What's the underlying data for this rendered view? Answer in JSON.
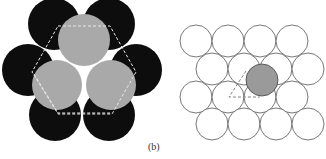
{
  "figure": {
    "caption": "(b)",
    "colors": {
      "black_sphere": "#0d0d0d",
      "gray_sphere": "#a9a9a9",
      "outline_circle_stroke": "#555555",
      "highlight_sphere": "#9a9a9a",
      "dashed_line_light": "#e8e8e8",
      "dashed_line_dark": "#666666"
    },
    "left_panel": {
      "description": "close-packed spheres: six black spheres with three gray spheres on top, dashed hexagon outline and triangle",
      "black_spheres": [
        {
          "cx": 54,
          "cy": 24,
          "r": 26
        },
        {
          "cx": 109,
          "cy": 24,
          "r": 26
        },
        {
          "cx": 28,
          "cy": 70,
          "r": 26
        },
        {
          "cx": 136,
          "cy": 70,
          "r": 26
        },
        {
          "cx": 55,
          "cy": 115,
          "r": 26
        },
        {
          "cx": 109,
          "cy": 115,
          "r": 26
        }
      ],
      "gray_spheres": [
        {
          "cx": 84,
          "cy": 40,
          "r": 26
        },
        {
          "cx": 57,
          "cy": 85,
          "r": 25
        },
        {
          "cx": 111,
          "cy": 85,
          "r": 25
        }
      ],
      "dashed_hexagon": "58,26 110,26 136,72 110,114 58,114 32,72",
      "dashed_triangle": "40,78 84,28 ... ",
      "white_gaps": [
        {
          "cx": 56,
          "cy": 54
        },
        {
          "cx": 111,
          "cy": 54
        },
        {
          "cx": 84,
          "cy": 101
        }
      ]
    },
    "right_panel": {
      "description": "single layer of close-packed circles with one shaded circle and dashed triangle",
      "circles": [
        {
          "cx": 196,
          "cy": 41
        },
        {
          "cx": 228,
          "cy": 41
        },
        {
          "cx": 260,
          "cy": 41
        },
        {
          "cx": 292,
          "cy": 41
        },
        {
          "cx": 212,
          "cy": 69
        },
        {
          "cx": 244,
          "cy": 69
        },
        {
          "cx": 308,
          "cy": 69
        },
        {
          "cx": 196,
          "cy": 97
        },
        {
          "cx": 228,
          "cy": 97
        },
        {
          "cx": 260,
          "cy": 97
        },
        {
          "cx": 292,
          "cy": 97
        },
        {
          "cx": 212,
          "cy": 124
        },
        {
          "cx": 244,
          "cy": 124
        },
        {
          "cx": 276,
          "cy": 124
        },
        {
          "cx": 308,
          "cy": 124
        }
      ],
      "highlighted_circle": {
        "cx": 262,
        "cy": 80,
        "r": 16
      },
      "circle_radius": 16,
      "dashed_triangle": "245,71 229,97 260,97"
    }
  }
}
